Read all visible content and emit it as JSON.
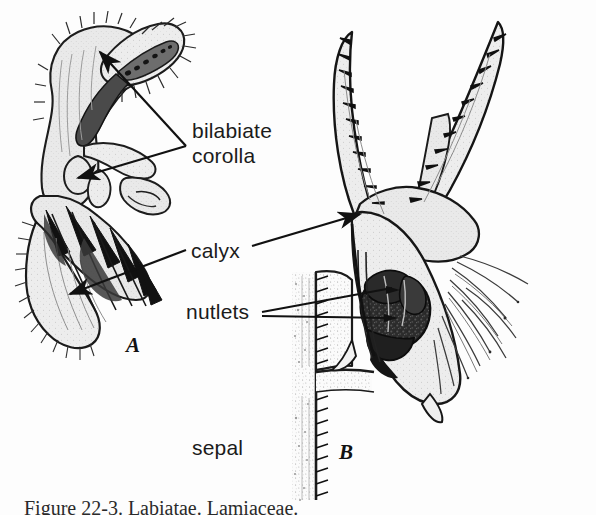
{
  "figure": {
    "background_color": "#fdfdfd",
    "ink_color": "#1b1b1b",
    "type": "botanical-line-illustration",
    "panels": [
      {
        "id": "A",
        "label": "A",
        "description": "longitudinal section of bilabiate flower with calyx"
      },
      {
        "id": "B",
        "label": "B",
        "description": "fruiting calyx cut open exposing nutlets, with sepal and stem"
      }
    ],
    "labels": [
      {
        "name": "bilabiate-corolla",
        "line1": "bilabiate",
        "line2": "corolla",
        "leader": "two-arrows-left"
      },
      {
        "name": "calyx",
        "text": "calyx",
        "leader": "two-lines-both-sides"
      },
      {
        "name": "nutlets",
        "text": "nutlets",
        "leader": "two-lines-right"
      },
      {
        "name": "sepal",
        "text": "sepal",
        "leader": "none"
      }
    ],
    "caption": "Figure 22-3. Labiatae. Lamiaceae."
  }
}
